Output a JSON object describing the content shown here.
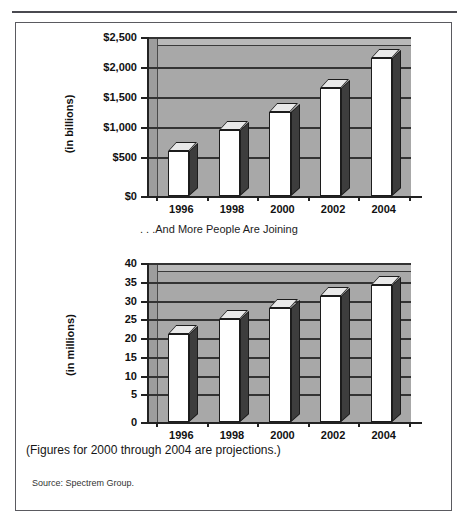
{
  "figure": {
    "clipped_header": "",
    "middle_caption": ". . .And More People Are Joining",
    "note": "(Figures for 2000 through 2004 are projections.)",
    "source": "Source:  Spectrem Group.",
    "frame_border_color": "#5a5a60",
    "plot_fill_color": "#a8a8a8",
    "bar_face_color": "#ffffff",
    "bar_side_color": "#3d3d3d"
  },
  "chart_data": [
    {
      "type": "bar",
      "title": "",
      "xlabel": "",
      "ylabel": "(in billions)",
      "categories": [
        "1996",
        "1998",
        "2000",
        "2002",
        "2004"
      ],
      "values": [
        750,
        1100,
        1400,
        1800,
        2300
      ],
      "ylim": [
        0,
        2500
      ],
      "yticks": [
        0,
        500,
        1000,
        1500,
        2000,
        2500
      ],
      "ytick_labels": [
        "$0",
        "$500",
        "$1,000",
        "$1,500",
        "$2,000",
        "$2,500"
      ],
      "grid": true,
      "legend": "none"
    },
    {
      "type": "bar",
      "title": "",
      "xlabel": "",
      "ylabel": "(in millions)",
      "categories": [
        "1996",
        "1998",
        "2000",
        "2002",
        "2004"
      ],
      "values": [
        23.5,
        27.5,
        30.5,
        33.5,
        36.5
      ],
      "ylim": [
        0,
        40
      ],
      "yticks": [
        0,
        5,
        10,
        15,
        20,
        25,
        30,
        35,
        40
      ],
      "ytick_labels": [
        "0",
        "5",
        "10",
        "15",
        "20",
        "25",
        "30",
        "35",
        "40"
      ],
      "grid": true,
      "legend": "none"
    }
  ]
}
